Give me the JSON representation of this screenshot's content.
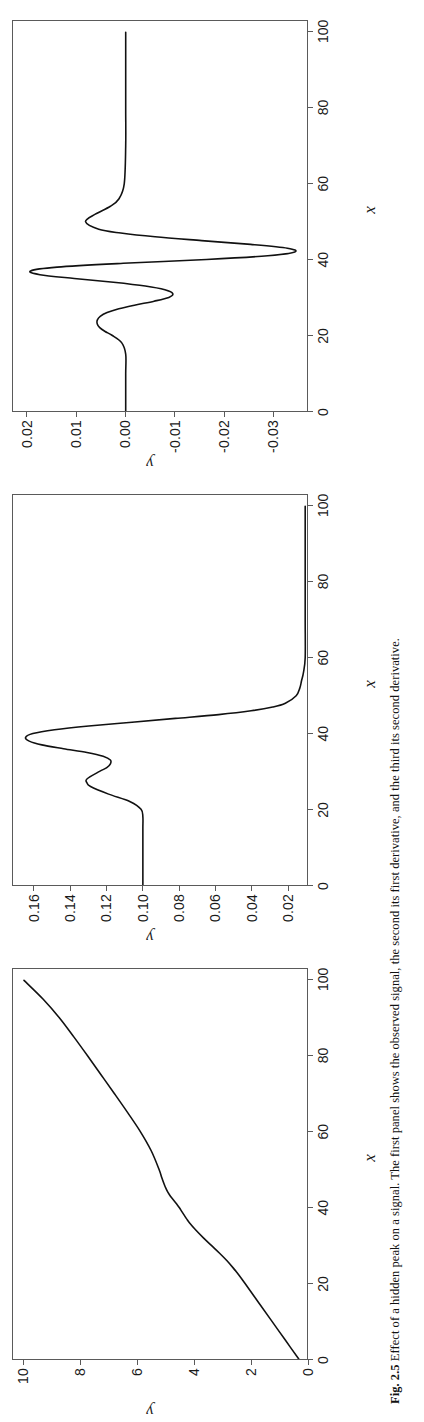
{
  "figure": {
    "caption_label": "Fig. 2.5",
    "caption_text": "Effect of a hidden peak on a signal. The first panel shows the observed signal, the second its first derivative, and the third its second derivative."
  },
  "axes": {
    "xlabel": "x",
    "ylabel": "y"
  },
  "chart_data": [
    {
      "type": "line",
      "title": "",
      "xlabel": "x",
      "ylabel": "y",
      "xlim": [
        0,
        103
      ],
      "ylim": [
        -0.3,
        10.4
      ],
      "xticks": [
        0,
        20,
        40,
        60,
        80,
        100
      ],
      "xticklabels": [
        "0",
        "20",
        "40",
        "60",
        "80",
        "100"
      ],
      "yticks": [
        0,
        2,
        4,
        6,
        8,
        10
      ],
      "yticklabels": [
        "0",
        "2",
        "4",
        "6",
        "8",
        "10"
      ],
      "grid": false,
      "legend": "none",
      "series": [
        {
          "name": "signal",
          "x": [
            0,
            5,
            10,
            15,
            20,
            22,
            24,
            26,
            28,
            30,
            32,
            34,
            36,
            37,
            38,
            39,
            40,
            41,
            42,
            43,
            44,
            45,
            46,
            48,
            50,
            55,
            60,
            65,
            70,
            75,
            80,
            85,
            90,
            95,
            100
          ],
          "y": [
            0.0,
            0.49,
            0.98,
            1.47,
            1.96,
            2.16,
            2.38,
            2.62,
            2.89,
            3.18,
            3.47,
            3.74,
            3.98,
            4.08,
            4.17,
            4.26,
            4.35,
            4.45,
            4.56,
            4.67,
            4.76,
            4.83,
            4.89,
            4.99,
            5.08,
            5.37,
            5.76,
            6.22,
            6.7,
            7.19,
            7.68,
            8.18,
            8.7,
            9.3,
            10.0
          ]
        }
      ]
    },
    {
      "type": "line",
      "title": "",
      "xlabel": "x",
      "ylabel": "y",
      "xlim": [
        0,
        103
      ],
      "ylim": [
        0.009,
        0.172
      ],
      "xticks": [
        0,
        20,
        40,
        60,
        80,
        100
      ],
      "xticklabels": [
        "0",
        "20",
        "40",
        "60",
        "80",
        "100"
      ],
      "yticks": [
        0.02,
        0.04,
        0.06,
        0.08,
        0.1,
        0.12,
        0.14,
        0.16
      ],
      "yticklabels": [
        "0.02",
        "0.04",
        "0.06",
        "0.08",
        "0.10",
        "0.12",
        "0.14",
        "0.16"
      ],
      "grid": false,
      "legend": "none",
      "series": [
        {
          "name": "first derivative",
          "x": [
            0,
            5,
            10,
            15,
            18,
            20,
            22,
            24,
            26,
            27,
            28,
            30,
            31,
            32,
            33,
            34,
            35,
            36,
            37,
            38,
            39,
            40,
            41,
            42,
            43,
            44,
            45,
            46,
            47,
            48,
            50,
            52,
            54,
            56,
            60,
            70,
            80,
            90,
            100
          ],
          "y": [
            0.1,
            0.1,
            0.1,
            0.1,
            0.1,
            0.101,
            0.107,
            0.119,
            0.129,
            0.131,
            0.131,
            0.124,
            0.12,
            0.118,
            0.118,
            0.122,
            0.131,
            0.144,
            0.156,
            0.163,
            0.165,
            0.161,
            0.149,
            0.13,
            0.106,
            0.082,
            0.058,
            0.04,
            0.028,
            0.021,
            0.015,
            0.013,
            0.012,
            0.011,
            0.01,
            0.01,
            0.01,
            0.01,
            0.01
          ]
        }
      ]
    },
    {
      "type": "line",
      "title": "",
      "xlabel": "x",
      "ylabel": "y",
      "xlim": [
        0,
        103
      ],
      "ylim": [
        -0.037,
        0.023
      ],
      "xticks": [
        0,
        20,
        40,
        60,
        80,
        100
      ],
      "xticklabels": [
        "0",
        "20",
        "40",
        "60",
        "80",
        "100"
      ],
      "yticks": [
        0.02,
        0.01,
        0.0,
        -0.01,
        -0.02,
        -0.03
      ],
      "yticklabels": [
        "0.02",
        "0.01",
        "0.00",
        "-0.01",
        "-0.02",
        "-0.03"
      ],
      "grid": false,
      "legend": "none",
      "series": [
        {
          "name": "second derivative",
          "x": [
            0,
            5,
            10,
            15,
            18,
            20,
            21,
            22,
            23,
            24,
            25,
            26,
            27,
            28,
            29,
            30,
            31,
            32,
            33,
            34,
            35,
            36,
            37,
            38,
            39,
            40,
            41,
            42,
            43,
            44,
            45,
            46,
            47,
            48,
            50,
            52,
            54,
            56,
            60,
            70,
            80,
            90,
            100
          ],
          "y": [
            0.0,
            0.0,
            0.0,
            0.0,
            0.0008,
            0.0028,
            0.0042,
            0.0053,
            0.0058,
            0.0058,
            0.0052,
            0.0038,
            0.0014,
            -0.002,
            -0.0058,
            -0.0088,
            -0.0096,
            -0.008,
            -0.004,
            0.0025,
            0.0105,
            0.0175,
            0.0194,
            0.014,
            0.0005,
            -0.0165,
            -0.029,
            -0.0345,
            -0.033,
            -0.0255,
            -0.0155,
            -0.006,
            0.001,
            0.0055,
            0.0082,
            0.0062,
            0.0032,
            0.0014,
            0.0003,
            0.0,
            0.0,
            0.0,
            0.0
          ]
        }
      ]
    }
  ]
}
